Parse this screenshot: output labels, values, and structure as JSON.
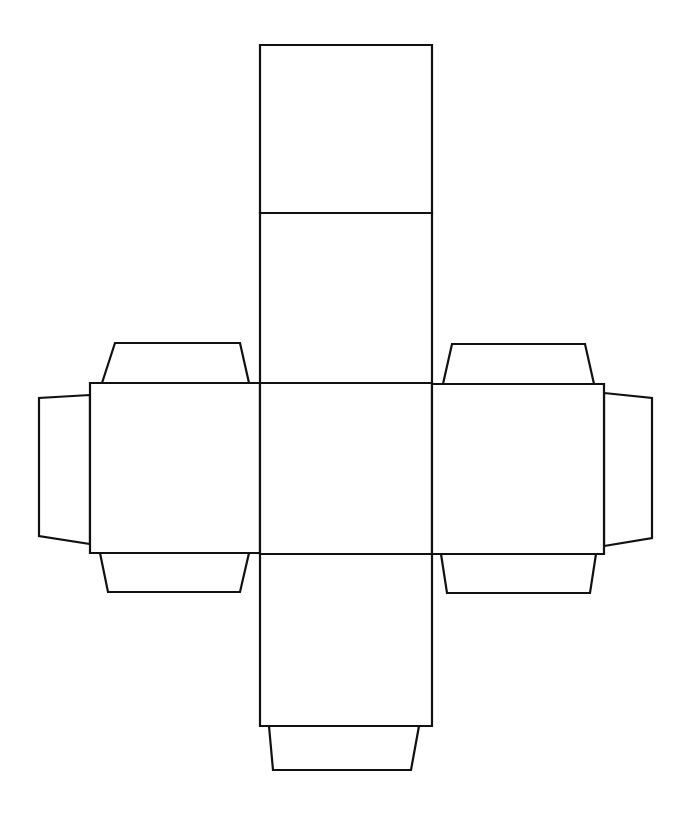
{
  "diagram": {
    "type": "cube-net-with-glue-tabs",
    "stroke_color": "#111111",
    "background": "#ffffff",
    "faces": [
      {
        "name": "top-face",
        "points": "260,45 432,45 432,213 260,213"
      },
      {
        "name": "upper-middle-face",
        "points": "260,213 432,213 432,383 260,383"
      },
      {
        "name": "left-face",
        "points": "90,383 260,383 260,553 90,553"
      },
      {
        "name": "center-face",
        "points": "260,383 432,383 432,554 260,554"
      },
      {
        "name": "right-face",
        "points": "432,384 604,384 604,554 432,554"
      },
      {
        "name": "bottom-face",
        "points": "260,554 432,554 432,726 260,726"
      }
    ],
    "tabs": [
      {
        "name": "left-face-top-tab",
        "points": "102,383 115,343 240,343 249,383"
      },
      {
        "name": "left-face-bottom-tab",
        "points": "100,553 108,592 240,592 249,553"
      },
      {
        "name": "left-face-side-tab",
        "points": "90,395 39,398 39,536 90,544"
      },
      {
        "name": "right-face-top-tab",
        "points": "443,384 452,344 585,344 594,384"
      },
      {
        "name": "right-face-bottom-tab",
        "points": "441,554 447,593 590,593 596,554"
      },
      {
        "name": "right-face-side-tab",
        "points": "604,393 652,398 652,538 604,546"
      },
      {
        "name": "bottom-face-tab",
        "points": "269,726 273,770 411,770 419,726"
      }
    ]
  }
}
